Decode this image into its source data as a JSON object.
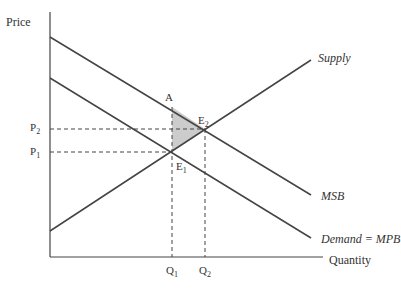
{
  "diagram": {
    "type": "externality-supply-demand",
    "axes": {
      "y_label": "Price",
      "x_label": "Quantity"
    },
    "curves": [
      {
        "name": "Supply",
        "label": "Supply",
        "direction": "upward"
      },
      {
        "name": "MSB",
        "label": "MSB",
        "direction": "downward"
      },
      {
        "name": "Demand",
        "label": "Demand = MPB",
        "direction": "downward"
      }
    ],
    "points": {
      "A": "A",
      "E1": {
        "base": "E",
        "sub": "1"
      },
      "E2": {
        "base": "E",
        "sub": "2"
      }
    },
    "prices": {
      "P1": {
        "base": "P",
        "sub": "1"
      },
      "P2": {
        "base": "P",
        "sub": "2"
      }
    },
    "quantities": {
      "Q1": {
        "base": "Q",
        "sub": "1"
      },
      "Q2": {
        "base": "Q",
        "sub": "2"
      }
    },
    "shaded_region": "triangle A-E1-E2 (deadweight loss)",
    "colors": {
      "line": "#444444",
      "shade": "#cccccc",
      "text": "#333333"
    }
  }
}
